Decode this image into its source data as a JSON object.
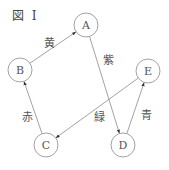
{
  "figure": {
    "title": "図 I"
  },
  "colors": {
    "line": "#8a8a8a",
    "node_stroke": "#8a8a8a",
    "text": "#555555",
    "arrowhead": "#333333"
  },
  "nodes": [
    {
      "id": "A",
      "label": "A",
      "cx": 86,
      "cy": 25,
      "r": 12
    },
    {
      "id": "B",
      "label": "B",
      "cx": 20,
      "cy": 70,
      "r": 12
    },
    {
      "id": "C",
      "label": "C",
      "cx": 46,
      "cy": 145,
      "r": 12
    },
    {
      "id": "D",
      "label": "D",
      "cx": 123,
      "cy": 145,
      "r": 12
    },
    {
      "id": "E",
      "label": "E",
      "cx": 148,
      "cy": 71,
      "r": 12
    }
  ],
  "edges": [
    {
      "from": "B",
      "to": "A",
      "label": "黄",
      "label_x": 44,
      "label_y": 47
    },
    {
      "from": "A",
      "to": "D",
      "label": "紫",
      "label_x": 103,
      "label_y": 64
    },
    {
      "from": "C",
      "to": "B",
      "label": "赤",
      "label_x": 22,
      "label_y": 121
    },
    {
      "from": "E",
      "to": "C",
      "label": "緑",
      "label_x": 94,
      "label_y": 121
    },
    {
      "from": "D",
      "to": "E",
      "label": "青",
      "label_x": 141,
      "label_y": 119
    }
  ]
}
